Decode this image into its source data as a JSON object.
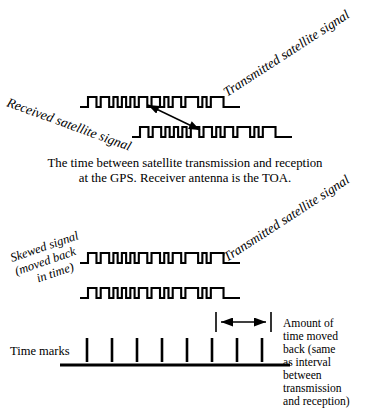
{
  "figure": {
    "width": 370,
    "height": 419,
    "background": "#ffffff",
    "ink": "#000000"
  },
  "labels": {
    "transmitted_top": "Transmitted satellite signal",
    "received": "Received satellite signal",
    "transmitted_bottom": "Transmitted satellite signal",
    "skewed_line1": "Skewed signal",
    "skewed_line2": "(moved back",
    "skewed_line3": "in time)",
    "time_marks": "Time marks"
  },
  "captions": {
    "toa_line1": "The time between satellite transmission and reception",
    "toa_line2": "at the GPS. Receiver antenna is the TOA."
  },
  "right_note": {
    "line1": "Amount of",
    "line2": "time moved",
    "line3": "back (same",
    "line4": "as interval",
    "line5": "between",
    "line6": "transmission",
    "line7": "and reception)"
  },
  "chart_data": {
    "type": "line",
    "waveforms": [
      {
        "name": "transmitted-satellite-signal-top",
        "row": 1,
        "x_start": 88,
        "x_end": 232,
        "baseline_y": 107,
        "high_y": 97,
        "pattern": [
          1,
          1,
          0,
          1,
          1,
          0,
          1,
          0,
          1,
          0,
          1,
          0,
          1,
          1,
          0,
          1,
          1,
          0,
          1,
          0,
          1,
          1,
          0,
          1,
          1,
          1,
          0,
          1,
          0,
          1,
          1,
          1,
          0,
          0
        ]
      },
      {
        "name": "received-satellite-signal",
        "row": 2,
        "x_start": 140,
        "x_end": 284,
        "baseline_y": 137,
        "high_y": 127,
        "pattern": [
          1,
          1,
          0,
          1,
          1,
          0,
          1,
          0,
          1,
          0,
          1,
          0,
          1,
          1,
          0,
          1,
          1,
          0,
          1,
          0,
          1,
          1,
          0,
          1,
          1,
          1,
          0,
          1,
          0,
          1,
          1,
          1,
          0,
          0
        ]
      },
      {
        "name": "skewed-signal-transmitted",
        "row": 3,
        "x_start": 88,
        "x_end": 232,
        "baseline_y": 263,
        "high_y": 253,
        "pattern": [
          1,
          1,
          0,
          1,
          1,
          0,
          1,
          0,
          1,
          0,
          1,
          0,
          1,
          1,
          0,
          1,
          1,
          0,
          1,
          0,
          1,
          1,
          0,
          1,
          1,
          1,
          0,
          1,
          0,
          1,
          1,
          1,
          0,
          0
        ]
      },
      {
        "name": "skewed-signal-moved-back",
        "row": 4,
        "x_start": 88,
        "x_end": 232,
        "baseline_y": 298,
        "high_y": 288,
        "pattern": [
          1,
          1,
          0,
          1,
          1,
          0,
          1,
          0,
          1,
          0,
          1,
          0,
          1,
          1,
          0,
          1,
          1,
          0,
          1,
          0,
          1,
          1,
          0,
          1,
          1,
          1,
          0,
          1,
          0,
          1,
          1,
          1,
          0,
          0
        ]
      }
    ],
    "time_axis": {
      "name": "time-marks-axis",
      "axis_y": 365,
      "x_start": 60,
      "x_end": 290,
      "tick_count": 8,
      "tick_first_x": 87,
      "tick_spacing": 25,
      "tick_top_y": 338,
      "tick_bottom_y": 362
    },
    "skew_interval": {
      "name": "amount-of-time-moved-back",
      "x_left": 216,
      "x_right": 271,
      "y": 322,
      "double_headed": true,
      "meaning": "one time-mark interval, equal to the transmission-to-reception delay"
    },
    "toa_arrow": {
      "name": "toa-delay-arrow",
      "x1": 200,
      "y1": 130,
      "x2": 148,
      "y2": 105,
      "double_headed": true,
      "meaning": "time between satellite transmission and reception"
    }
  }
}
